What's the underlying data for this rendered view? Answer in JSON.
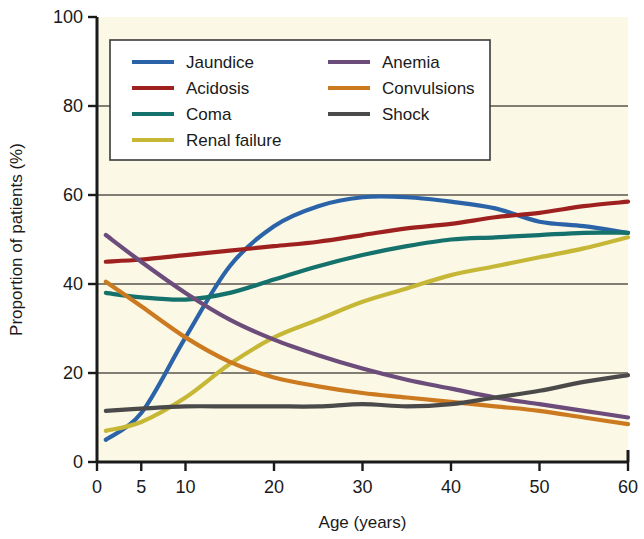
{
  "chart_data": {
    "type": "line",
    "title": "",
    "xlabel": "Age (years)",
    "ylabel": "Proportion of patients (%)",
    "xlim": [
      0,
      60
    ],
    "ylim": [
      0,
      100
    ],
    "xticks": [
      0,
      5,
      10,
      20,
      30,
      40,
      50,
      60
    ],
    "yticks": [
      0,
      20,
      40,
      60,
      80,
      100
    ],
    "grid": "horizontal",
    "legend_position": "top-inside",
    "plot_background": "#FBF8E6",
    "x": [
      1,
      5,
      10,
      15,
      20,
      25,
      30,
      35,
      40,
      45,
      50,
      55,
      60
    ],
    "series": [
      {
        "name": "Jaundice",
        "color": "#2B63A8",
        "values": [
          5,
          11,
          28,
          44,
          53,
          57.5,
          59.5,
          59.5,
          58.5,
          57,
          54,
          53,
          51.5
        ]
      },
      {
        "name": "Acidosis",
        "color": "#9E2120",
        "values": [
          45,
          45.5,
          46.5,
          47.5,
          48.5,
          49.5,
          51,
          52.5,
          53.5,
          55,
          56,
          57.5,
          58.5
        ]
      },
      {
        "name": "Coma",
        "color": "#14716B",
        "values": [
          38,
          37,
          36.5,
          38,
          41,
          44,
          46.5,
          48.5,
          50,
          50.5,
          51,
          51.5,
          51.5
        ]
      },
      {
        "name": "Renal failure",
        "color": "#C6B737",
        "values": [
          7,
          9,
          14.5,
          22,
          28,
          32,
          36,
          39,
          42,
          44,
          46,
          48,
          50.5
        ]
      },
      {
        "name": "Anemia",
        "color": "#6B4C7A",
        "values": [
          51,
          45,
          38,
          32,
          27.5,
          24,
          21,
          18.5,
          16.5,
          14.5,
          13,
          11.5,
          10
        ]
      },
      {
        "name": "Convulsions",
        "color": "#CC7A1F",
        "values": [
          40.5,
          35,
          28,
          22.5,
          19,
          17,
          15.5,
          14.5,
          13.5,
          12.5,
          11.5,
          10,
          8.5
        ]
      },
      {
        "name": "Shock",
        "color": "#4A4A4A",
        "values": [
          11.5,
          12,
          12.5,
          12.5,
          12.5,
          12.5,
          13,
          12.5,
          13,
          14.5,
          16,
          18,
          19.5
        ]
      }
    ]
  },
  "legend": {
    "columns": [
      {
        "items": [
          "Jaundice",
          "Acidosis",
          "Coma",
          "Renal failure"
        ]
      },
      {
        "items": [
          "Anemia",
          "Convulsions",
          "Shock"
        ]
      }
    ]
  },
  "axes": {
    "x_tick_labels": [
      "0",
      "5",
      "10",
      "20",
      "30",
      "40",
      "50",
      "60"
    ],
    "y_tick_labels": [
      "0",
      "20",
      "40",
      "60",
      "80",
      "100"
    ],
    "x_title": "Age (years)",
    "y_title": "Proportion of patients (%)"
  }
}
